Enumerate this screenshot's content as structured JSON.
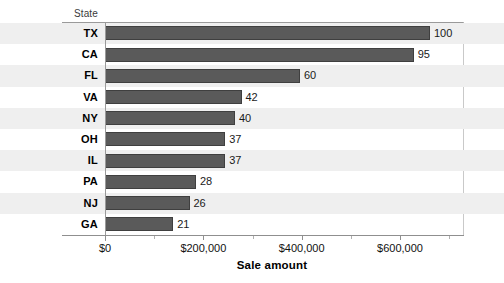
{
  "chart_data": {
    "type": "bar",
    "orientation": "horizontal",
    "title": "",
    "subtitle": "",
    "xlabel": "Sale amount",
    "ylabel": "State",
    "categories": [
      "TX",
      "CA",
      "FL",
      "VA",
      "NY",
      "OH",
      "IL",
      "PA",
      "NJ",
      "GA"
    ],
    "values": [
      100,
      95,
      60,
      42,
      40,
      37,
      37,
      28,
      26,
      21
    ],
    "data_labels": [
      "100",
      "95",
      "60",
      "42",
      "40",
      "37",
      "37",
      "28",
      "26",
      "21"
    ],
    "bar_color": "#5a5a5a",
    "bar_border_color": "#3f3f3f",
    "band_color": "#efefef",
    "background": "#ffffff",
    "grid": false,
    "legend": null,
    "xlim": [
      0,
      700000
    ],
    "x_tick_labels": [
      "$0",
      "$200,000",
      "$400,000",
      "$600,000"
    ],
    "x_tick_values": [
      0,
      200000,
      400000,
      600000
    ],
    "x_minor_tick_values": [
      100000,
      300000,
      500000,
      700000
    ],
    "value_scale_note": "bar label values correspond to sale amount in thousands of dollars"
  },
  "axis": {
    "y_caption": "State",
    "x_title": "Sale amount",
    "ticks": [
      {
        "label": "$0"
      },
      {
        "label": "$200,000"
      },
      {
        "label": "$400,000"
      },
      {
        "label": "$600,000"
      }
    ]
  },
  "rows": [
    {
      "state": "TX",
      "value": "100"
    },
    {
      "state": "CA",
      "value": "95"
    },
    {
      "state": "FL",
      "value": "60"
    },
    {
      "state": "VA",
      "value": "42"
    },
    {
      "state": "NY",
      "value": "40"
    },
    {
      "state": "OH",
      "value": "37"
    },
    {
      "state": "IL",
      "value": "37"
    },
    {
      "state": "PA",
      "value": "28"
    },
    {
      "state": "NJ",
      "value": "26"
    },
    {
      "state": "GA",
      "value": "21"
    }
  ]
}
